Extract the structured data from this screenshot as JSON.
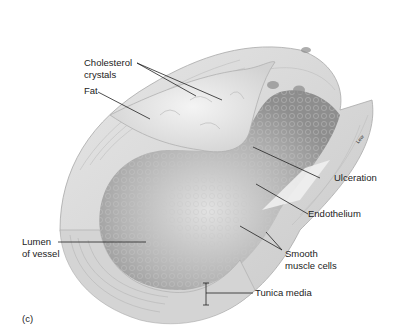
{
  "figure": {
    "panel_label": "(c)",
    "artist_signature": "Lew",
    "labels": {
      "cholesterol_line1": "Cholesterol",
      "cholesterol_line2": "crystals",
      "fat": "Fat",
      "ulceration": "Ulceration",
      "endothelium": "Endothelium",
      "lumen_line1": "Lumen",
      "lumen_line2": "of vessel",
      "smooth_line1": "Smooth",
      "smooth_line2": "muscle cells",
      "tunica_media": "Tunica media"
    }
  }
}
